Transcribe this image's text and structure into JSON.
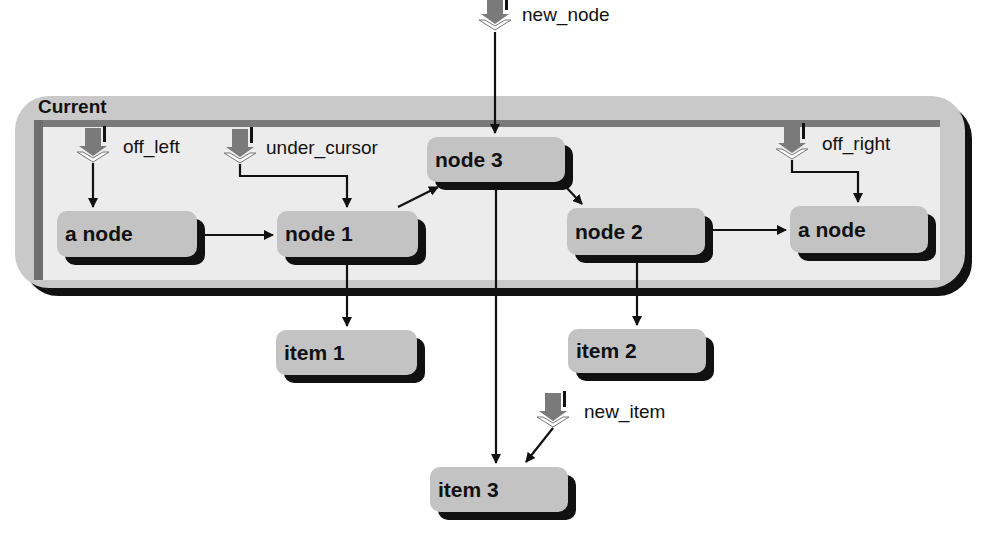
{
  "container": {
    "title": "Current"
  },
  "pointers": {
    "new_node": "new_node",
    "off_left": "off_left",
    "under_cursor": "under_cursor",
    "off_right": "off_right",
    "new_item": "new_item"
  },
  "nodes": {
    "a_node_left": "a node",
    "node_1": "node 1",
    "node_3": "node 3",
    "node_2": "node 2",
    "a_node_right": "a node"
  },
  "items": {
    "item_1": "item 1",
    "item_2": "item 2",
    "item_3": "item 3"
  },
  "colors": {
    "container_fill": "#c9c9c9",
    "panel_fill": "#ececec",
    "node_fill": "#c3c3c3",
    "shadow": "#111111",
    "pointer_fill": "#7a7a7a"
  }
}
